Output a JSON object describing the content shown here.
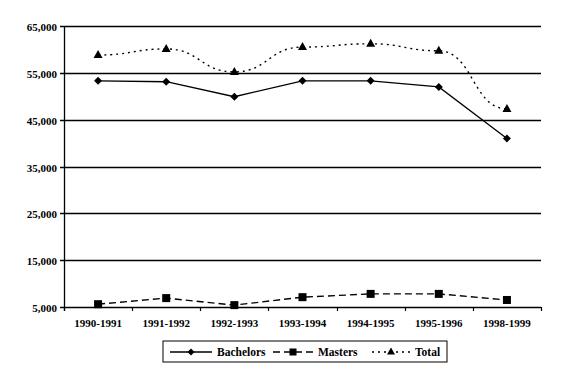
{
  "chart_data": {
    "type": "line",
    "title": "",
    "xlabel": "",
    "ylabel": "",
    "categories": [
      "1990-1991",
      "1991-1992",
      "1992-1993",
      "1993-1994",
      "1994-1995",
      "1995-1996",
      "1998-1999"
    ],
    "series": [
      {
        "name": "Bachelors",
        "marker": "diamond",
        "line": "solid",
        "values": [
          53300,
          53100,
          49900,
          53300,
          53300,
          52000,
          41000
        ]
      },
      {
        "name": "Masters",
        "marker": "square",
        "line": "dashed",
        "values": [
          5600,
          6900,
          5400,
          7100,
          7800,
          7800,
          6500
        ]
      },
      {
        "name": "Total",
        "marker": "triangle",
        "line": "dotted",
        "values": [
          58800,
          60100,
          55200,
          60500,
          61200,
          59700,
          47300
        ]
      }
    ],
    "ylim": [
      5000,
      65000
    ],
    "yticks": [
      5000,
      15000,
      25000,
      35000,
      45000,
      55000,
      65000
    ],
    "ytick_labels": [
      "5,000",
      "15,000",
      "25,000",
      "35,000",
      "45,000",
      "55,000",
      "65,000"
    ],
    "grid": true,
    "legend_position": "bottom"
  },
  "colors": {
    "line": "#000000",
    "grid": "#000000",
    "background": "#ffffff"
  }
}
